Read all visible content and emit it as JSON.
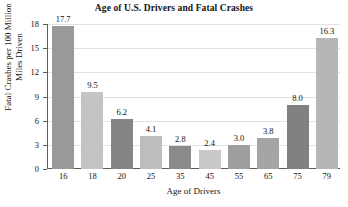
{
  "chart_data": {
    "type": "bar",
    "title": "Age of U.S. Drivers and Fatal Crashes",
    "xlabel": "Age of Drivers",
    "ylabel_line1": "Fatal Crashes per 100 Million",
    "ylabel_line2": "Miles Driven",
    "categories": [
      "16",
      "18",
      "20",
      "25",
      "35",
      "45",
      "55",
      "65",
      "75",
      "79"
    ],
    "values": [
      17.7,
      9.5,
      6.2,
      4.1,
      2.8,
      2.4,
      3.0,
      3.8,
      8.0,
      16.3
    ],
    "value_labels": [
      "17.7",
      "9.5",
      "6.2",
      "4.1",
      "2.8",
      "2.4",
      "3.0",
      "3.8",
      "8.0",
      "16.3"
    ],
    "bar_colors": [
      "#999999",
      "#c4c4c4",
      "#858585",
      "#bdbdbd",
      "#8a8a8a",
      "#c9c9c9",
      "#9e9e9e",
      "#a5a5a5",
      "#818181",
      "#b6b6b6"
    ],
    "ylim": [
      0,
      18
    ],
    "yticks": [
      0,
      3,
      6,
      9,
      12,
      15,
      18
    ],
    "ytick_labels": [
      "0",
      "3",
      "6",
      "9",
      "12",
      "15",
      "18"
    ],
    "grid": true,
    "legend": "none",
    "axis_color": "#5d5d5d",
    "grid_color": "#e2e2e2",
    "background": "#ffffff"
  }
}
